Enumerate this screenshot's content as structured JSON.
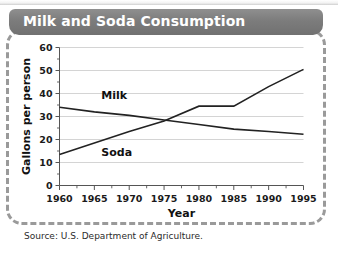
{
  "figure": {
    "title": "Milk and Soda Consumption",
    "source": "Source: U.S. Department of Agriculture."
  },
  "chart_data": {
    "type": "line",
    "title": "Milk and Soda Consumption",
    "xlabel": "Year",
    "ylabel": "Gallons per person",
    "x": [
      1960,
      1965,
      1970,
      1975,
      1980,
      1985,
      1990,
      1995
    ],
    "xlim": [
      1960,
      1995
    ],
    "ylim": [
      0,
      60
    ],
    "xticks": [
      "1960",
      "1965",
      "1970",
      "1975",
      "1980",
      "1985",
      "1990",
      "1995"
    ],
    "yticks": [
      "0",
      "10",
      "20",
      "30",
      "40",
      "50",
      "60"
    ],
    "y_minor_tick_step": 5,
    "grid": "horizontal",
    "legend": "inline-labels",
    "series": [
      {
        "name": "Milk",
        "color": "#222222",
        "values": [
          34.0,
          32.0,
          30.5,
          28.5,
          26.5,
          24.5,
          23.5,
          22.3
        ],
        "label_x": 1966,
        "label_y": 37.5
      },
      {
        "name": "Soda",
        "color": "#222222",
        "values": [
          13.5,
          18.5,
          23.5,
          28.0,
          34.5,
          34.5,
          43.0,
          50.5
        ],
        "label_x": 1966,
        "label_y": 13.0
      }
    ],
    "annotations": [
      {
        "text": "Milk",
        "x": 1966,
        "y": 37.5
      },
      {
        "text": "Soda",
        "x": 1966,
        "y": 13.0
      }
    ]
  },
  "colors": {
    "banner": "#7c7c7c",
    "banner_text": "#ffffff",
    "frame_dash": "#9a9a9a",
    "grid": "#c9c9c9",
    "axis": "#555555",
    "line": "#222222"
  }
}
